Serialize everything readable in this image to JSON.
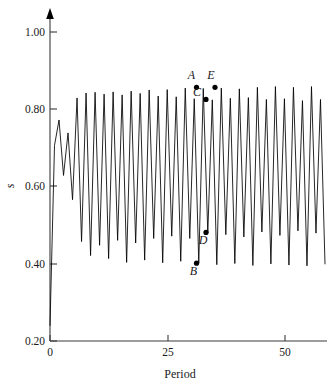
{
  "chart_data": {
    "type": "line",
    "title": "",
    "subtitle": "",
    "xlabel": "Period",
    "ylabel": "s",
    "xlim": [
      0,
      61
    ],
    "ylim": [
      0.2,
      1.04
    ],
    "grid": false,
    "legend": null,
    "x_ticks": [
      {
        "value": 0,
        "label": "0"
      },
      {
        "value": 25,
        "label": "25"
      },
      {
        "value": 50,
        "label": "50"
      }
    ],
    "y_ticks": [
      {
        "value": 0.2,
        "label": "0.20"
      },
      {
        "value": 0.4,
        "label": "0.40"
      },
      {
        "value": 0.6,
        "label": "0.60"
      },
      {
        "value": 0.8,
        "label": "0.80"
      },
      {
        "value": 1.0,
        "label": "1.00"
      }
    ],
    "y_axis_arrow": true,
    "series": [
      {
        "name": "s",
        "x": [
          0,
          1,
          2,
          3,
          4,
          5,
          6,
          7,
          8,
          9,
          10,
          11,
          12,
          13,
          14,
          15,
          16,
          17,
          18,
          19,
          20,
          21,
          22,
          23,
          24,
          25,
          26,
          27,
          28,
          29,
          30,
          31,
          32,
          33,
          34,
          35,
          36,
          37,
          38,
          39,
          40,
          41,
          42,
          43,
          44,
          45,
          46,
          47,
          48,
          49,
          50,
          51,
          52,
          53,
          54,
          55,
          56,
          57,
          58,
          59,
          60,
          61
        ],
        "values": [
          0.24,
          0.715,
          0.782,
          0.636,
          0.748,
          0.572,
          0.84,
          0.462,
          0.853,
          0.425,
          0.855,
          0.452,
          0.85,
          0.417,
          0.856,
          0.465,
          0.848,
          0.407,
          0.858,
          0.458,
          0.852,
          0.413,
          0.861,
          0.47,
          0.845,
          0.406,
          0.862,
          0.476,
          0.843,
          0.41,
          0.866,
          0.47,
          0.838,
          0.405,
          0.865,
          0.484,
          0.835,
          0.401,
          0.866,
          0.48,
          0.839,
          0.404,
          0.864,
          0.474,
          0.841,
          0.399,
          0.868,
          0.487,
          0.836,
          0.403,
          0.87,
          0.478,
          0.838,
          0.4,
          0.868,
          0.49,
          0.833,
          0.398,
          0.87,
          0.484,
          0.836,
          0.402
        ]
      }
    ],
    "annotations": [
      {
        "id": "A",
        "label": "A",
        "x": 32.5,
        "y": 0.868,
        "label_dx": -5,
        "label_dy": -8,
        "marker": true
      },
      {
        "id": "B",
        "label": "B",
        "x": 32.5,
        "y": 0.405,
        "label_dx": -3,
        "label_dy": 12,
        "marker": true
      },
      {
        "id": "C",
        "label": "C",
        "x": 34.6,
        "y": 0.836,
        "label_dx": -9,
        "label_dy": -3,
        "marker": true
      },
      {
        "id": "D",
        "label": "D",
        "x": 34.6,
        "y": 0.486,
        "label_dx": -3,
        "label_dy": 12,
        "marker": true
      },
      {
        "id": "E",
        "label": "E",
        "x": 36.6,
        "y": 0.868,
        "label_dx": -4,
        "label_dy": -8,
        "marker": true
      }
    ],
    "colors": {
      "series_line": "#000000",
      "axis": "#3a3a3a",
      "marker": "#000000",
      "background": "#ffffff",
      "text": "#1a1a1a"
    }
  },
  "geometry": {
    "plot_left_px": 50,
    "plot_bottom_px": 341,
    "plot_right_px": 325,
    "plot_top_px": 22,
    "x_per_unit_px": 4.7,
    "y_top_value": 1.04
  }
}
